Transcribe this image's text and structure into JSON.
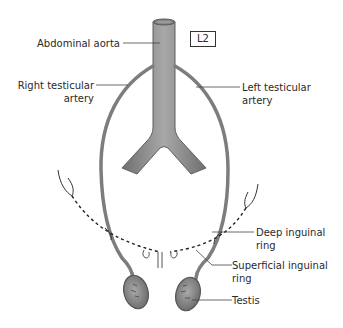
{
  "diagram": {
    "vertebral_level": "L2",
    "labels": {
      "abdominal_aorta": "Abdominal aorta",
      "right_testicular_artery_1": "Right testicular",
      "right_testicular_artery_2": "artery",
      "left_testicular_artery_1": "Left testicular",
      "left_testicular_artery_2": "artery",
      "deep_inguinal_ring_1": "Deep inguinal",
      "deep_inguinal_ring_2": "ring",
      "superficial_inguinal_ring_1": "Superficial inguinal",
      "superficial_inguinal_ring_2": "ring",
      "testis": "Testis"
    },
    "colors": {
      "vessel": "#8a8a8a",
      "vessel_dark": "#5f5f5f",
      "leader": "#444444",
      "text": "#2a2a2a"
    }
  }
}
